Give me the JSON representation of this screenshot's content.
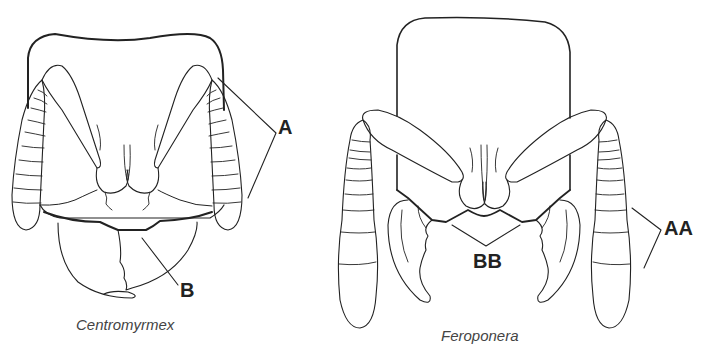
{
  "figure": {
    "panels": [
      {
        "id": "left",
        "caption": "Centromyrmex",
        "labels": [
          {
            "text": "A",
            "target": "antennae (short, segmented)"
          },
          {
            "text": "B",
            "target": "mandibles (triangular, closed)"
          }
        ]
      },
      {
        "id": "right",
        "caption": "Feroponera",
        "labels": [
          {
            "text": "AA",
            "target": "antennae (long, clubbed)"
          },
          {
            "text": "BB",
            "target": "clypeal margin / mandibles (curved, open)"
          }
        ]
      }
    ],
    "colors": {
      "line": "#222222",
      "thin_line": "#555555",
      "label_text": "#222222",
      "caption_text": "#444444",
      "background": "#ffffff"
    }
  }
}
